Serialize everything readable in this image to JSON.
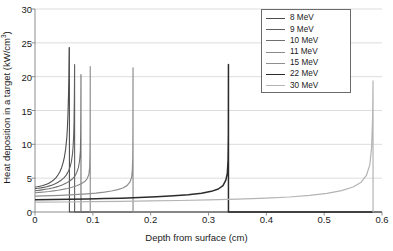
{
  "chart_data": {
    "type": "line",
    "title": "",
    "xlabel": "Depth from surface (cm)",
    "ylabel": "Heat deposition in a target (kW/cm3)",
    "ylabel_prefix": "Heat deposition in a target (kW/cm",
    "ylabel_sup": "3",
    "ylabel_suffix": ")",
    "xlim": [
      0,
      0.6
    ],
    "ylim": [
      0,
      30
    ],
    "xticks": [
      "0",
      "0.1",
      "0.2",
      "0.3",
      "0.4",
      "0.5",
      "0.6"
    ],
    "xtick_values": [
      0,
      0.1,
      0.2,
      0.3,
      0.4,
      0.5,
      0.6
    ],
    "yticks": [
      "0",
      "5",
      "10",
      "15",
      "20",
      "25",
      "30"
    ],
    "ytick_values": [
      0,
      5,
      10,
      15,
      20,
      25,
      30
    ],
    "grid": "horizontal",
    "grid_color": "#cfcfcf",
    "axis_color": "#808080",
    "legend_position": "top-right",
    "legend_entries": [
      "8 MeV",
      "9 MeV",
      "10 MeV",
      "11 MeV",
      "15 MeV",
      "22 MeV",
      "30 MeV"
    ],
    "series": [
      {
        "name": "8 MeV",
        "color": "#4d4d4d",
        "width": 1.1,
        "range_cm": 0.0595,
        "peak_value": 24.3,
        "surface_value": 3.7,
        "points": [
          [
            0.0,
            3.7
          ],
          [
            0.004,
            3.74
          ],
          [
            0.008,
            3.8
          ],
          [
            0.012,
            3.88
          ],
          [
            0.016,
            3.98
          ],
          [
            0.02,
            4.1
          ],
          [
            0.024,
            4.26
          ],
          [
            0.028,
            4.46
          ],
          [
            0.032,
            4.72
          ],
          [
            0.036,
            5.05
          ],
          [
            0.04,
            5.5
          ],
          [
            0.043,
            5.95
          ],
          [
            0.046,
            6.55
          ],
          [
            0.049,
            7.4
          ],
          [
            0.051,
            8.2
          ],
          [
            0.053,
            9.3
          ],
          [
            0.055,
            11.0
          ],
          [
            0.056,
            12.4
          ],
          [
            0.057,
            14.5
          ],
          [
            0.058,
            17.6
          ],
          [
            0.0585,
            20.0
          ],
          [
            0.059,
            24.3
          ],
          [
            0.0595,
            24.3
          ],
          [
            0.0595,
            0.0
          ],
          [
            0.6,
            0.0
          ]
        ]
      },
      {
        "name": "9 MeV",
        "color": "#5e5e5e",
        "width": 1.1,
        "range_cm": 0.0685,
        "peak_value": 21.8,
        "surface_value": 3.45,
        "points": [
          [
            0.0,
            3.45
          ],
          [
            0.005,
            3.5
          ],
          [
            0.01,
            3.56
          ],
          [
            0.015,
            3.64
          ],
          [
            0.02,
            3.74
          ],
          [
            0.025,
            3.86
          ],
          [
            0.03,
            4.0
          ],
          [
            0.035,
            4.18
          ],
          [
            0.04,
            4.4
          ],
          [
            0.045,
            4.68
          ],
          [
            0.05,
            5.05
          ],
          [
            0.054,
            5.45
          ],
          [
            0.058,
            6.05
          ],
          [
            0.061,
            6.75
          ],
          [
            0.063,
            7.5
          ],
          [
            0.065,
            8.7
          ],
          [
            0.066,
            9.8
          ],
          [
            0.067,
            11.6
          ],
          [
            0.0675,
            13.4
          ],
          [
            0.068,
            16.5
          ],
          [
            0.0683,
            19.5
          ],
          [
            0.0685,
            21.8
          ],
          [
            0.0685,
            0.0
          ],
          [
            0.6,
            0.0
          ]
        ]
      },
      {
        "name": "10 MeV",
        "color": "#707070",
        "width": 1.1,
        "range_cm": 0.0795,
        "peak_value": 20.3,
        "surface_value": 3.15,
        "points": [
          [
            0.0,
            3.15
          ],
          [
            0.006,
            3.2
          ],
          [
            0.012,
            3.27
          ],
          [
            0.018,
            3.35
          ],
          [
            0.024,
            3.44
          ],
          [
            0.03,
            3.55
          ],
          [
            0.036,
            3.68
          ],
          [
            0.042,
            3.84
          ],
          [
            0.048,
            4.03
          ],
          [
            0.054,
            4.27
          ],
          [
            0.06,
            4.58
          ],
          [
            0.065,
            4.92
          ],
          [
            0.069,
            5.32
          ],
          [
            0.072,
            5.8
          ],
          [
            0.075,
            6.55
          ],
          [
            0.077,
            7.5
          ],
          [
            0.0785,
            9.0
          ],
          [
            0.079,
            11.5
          ],
          [
            0.0793,
            15.0
          ],
          [
            0.0795,
            20.3
          ],
          [
            0.0795,
            0.0
          ],
          [
            0.6,
            0.0
          ]
        ]
      },
      {
        "name": "11 MeV",
        "color": "#8a8a8a",
        "width": 1.1,
        "range_cm": 0.0955,
        "peak_value": 21.5,
        "surface_value": 2.85,
        "points": [
          [
            0.0,
            2.85
          ],
          [
            0.008,
            2.9
          ],
          [
            0.016,
            2.96
          ],
          [
            0.024,
            3.03
          ],
          [
            0.032,
            3.12
          ],
          [
            0.04,
            3.22
          ],
          [
            0.048,
            3.34
          ],
          [
            0.056,
            3.48
          ],
          [
            0.064,
            3.65
          ],
          [
            0.072,
            3.88
          ],
          [
            0.08,
            4.18
          ],
          [
            0.086,
            4.5
          ],
          [
            0.09,
            4.9
          ],
          [
            0.093,
            5.5
          ],
          [
            0.0945,
            6.6
          ],
          [
            0.095,
            8.5
          ],
          [
            0.0953,
            12.0
          ],
          [
            0.0955,
            21.5
          ],
          [
            0.0955,
            0.0
          ],
          [
            0.6,
            0.0
          ]
        ]
      },
      {
        "name": "15 MeV",
        "color": "#8f8f8f",
        "width": 1.2,
        "range_cm": 0.1695,
        "peak_value": 21.3,
        "surface_value": 2.35,
        "points": [
          [
            0.0,
            2.35
          ],
          [
            0.015,
            2.38
          ],
          [
            0.03,
            2.42
          ],
          [
            0.045,
            2.47
          ],
          [
            0.06,
            2.53
          ],
          [
            0.075,
            2.6
          ],
          [
            0.09,
            2.69
          ],
          [
            0.105,
            2.8
          ],
          [
            0.12,
            2.95
          ],
          [
            0.132,
            3.1
          ],
          [
            0.143,
            3.3
          ],
          [
            0.152,
            3.55
          ],
          [
            0.159,
            3.9
          ],
          [
            0.164,
            4.4
          ],
          [
            0.167,
            5.1
          ],
          [
            0.1683,
            6.2
          ],
          [
            0.169,
            8.0
          ],
          [
            0.1693,
            12.0
          ],
          [
            0.1695,
            21.3
          ],
          [
            0.1695,
            0.0
          ],
          [
            0.6,
            0.0
          ]
        ]
      },
      {
        "name": "22 MeV",
        "color": "#2b2b2b",
        "width": 1.5,
        "range_cm": 0.3345,
        "peak_value": 21.8,
        "surface_value": 1.8,
        "points": [
          [
            0.0,
            1.8
          ],
          [
            0.03,
            1.83
          ],
          [
            0.06,
            1.87
          ],
          [
            0.09,
            1.92
          ],
          [
            0.12,
            1.98
          ],
          [
            0.15,
            2.05
          ],
          [
            0.18,
            2.14
          ],
          [
            0.21,
            2.25
          ],
          [
            0.24,
            2.4
          ],
          [
            0.265,
            2.56
          ],
          [
            0.288,
            2.78
          ],
          [
            0.305,
            3.05
          ],
          [
            0.317,
            3.4
          ],
          [
            0.325,
            3.9
          ],
          [
            0.33,
            4.7
          ],
          [
            0.3325,
            5.7
          ],
          [
            0.3338,
            7.6
          ],
          [
            0.3343,
            11.5
          ],
          [
            0.3345,
            21.8
          ],
          [
            0.3345,
            0.0
          ],
          [
            0.6,
            0.0
          ]
        ]
      },
      {
        "name": "30 MeV",
        "color": "#b4b4b4",
        "width": 1.2,
        "range_cm": 0.5845,
        "peak_value": 19.4,
        "surface_value": 1.45,
        "points": [
          [
            0.0,
            1.45
          ],
          [
            0.05,
            1.48
          ],
          [
            0.1,
            1.52
          ],
          [
            0.15,
            1.57
          ],
          [
            0.2,
            1.63
          ],
          [
            0.25,
            1.7
          ],
          [
            0.3,
            1.79
          ],
          [
            0.35,
            1.9
          ],
          [
            0.4,
            2.05
          ],
          [
            0.44,
            2.22
          ],
          [
            0.475,
            2.45
          ],
          [
            0.505,
            2.75
          ],
          [
            0.53,
            3.15
          ],
          [
            0.55,
            3.7
          ],
          [
            0.564,
            4.4
          ],
          [
            0.573,
            5.4
          ],
          [
            0.579,
            7.0
          ],
          [
            0.582,
            9.5
          ],
          [
            0.5838,
            14.0
          ],
          [
            0.5845,
            19.4
          ],
          [
            0.5845,
            0.0
          ],
          [
            0.6,
            0.0
          ]
        ]
      }
    ]
  },
  "plot_geometry": {
    "left": 35,
    "right": 382,
    "top": 9,
    "bottom": 212
  },
  "legend_box": {
    "left": 261,
    "top": 9,
    "width": 90,
    "height": 84
  }
}
